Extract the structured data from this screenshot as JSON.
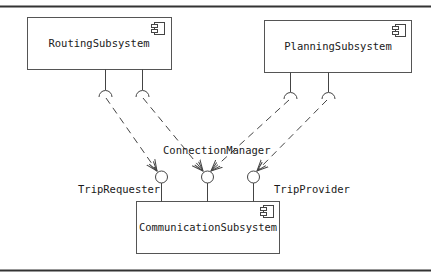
{
  "diagram": {
    "type": "UML component diagram",
    "components": [
      {
        "id": "routing",
        "label": "RoutingSubsystem",
        "x": 27,
        "y": 17,
        "w": 145,
        "h": 52,
        "icon": "component-icon"
      },
      {
        "id": "planning",
        "label": "PlanningSubsystem",
        "x": 264,
        "y": 20,
        "w": 148,
        "h": 52,
        "icon": "component-icon"
      },
      {
        "id": "communication",
        "label": "CommunicationSubsystem",
        "x": 136,
        "y": 201,
        "w": 144,
        "h": 53,
        "icon": "component-icon"
      }
    ],
    "provided_interfaces": [
      {
        "id": "trip-requester",
        "label": "TripRequester",
        "owner": "communication",
        "cx": 161,
        "cy": 177
      },
      {
        "id": "connection-manager",
        "label": "ConnectionManager",
        "owner": "communication",
        "cx": 207,
        "cy": 177
      },
      {
        "id": "trip-provider",
        "label": "TripProvider",
        "owner": "communication",
        "cx": 253,
        "cy": 177
      }
    ],
    "required_interfaces": [
      {
        "owner": "routing",
        "x": 105,
        "target": "trip-requester"
      },
      {
        "owner": "routing",
        "x": 142,
        "target": "connection-manager"
      },
      {
        "owner": "planning",
        "x": 290,
        "target": "connection-manager"
      },
      {
        "owner": "planning",
        "x": 328,
        "target": "trip-provider"
      }
    ]
  },
  "labels": {
    "routing": "RoutingSubsystem",
    "planning": "PlanningSubsystem",
    "communication": "CommunicationSubsystem",
    "trip_requester": "TripRequester",
    "connection_manager": "ConnectionManager",
    "trip_provider": "TripProvider"
  }
}
